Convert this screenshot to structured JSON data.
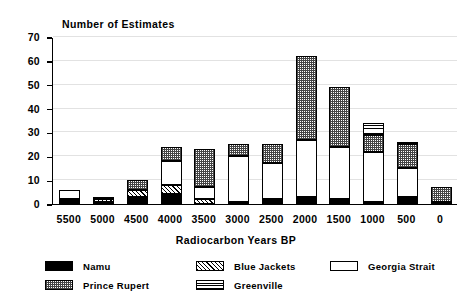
{
  "chart_data": {
    "type": "bar",
    "subtype": "stacked-bar",
    "title": "Number of Estimates",
    "xlabel": "Radiocarbon Years BP",
    "ylabel": "Number of Estimates",
    "ylim": [
      0,
      70
    ],
    "yticks": [
      0,
      10,
      20,
      30,
      40,
      50,
      60,
      70
    ],
    "grid": true,
    "legend_position": "bottom",
    "categories": [
      "5500",
      "5000",
      "4500",
      "4000",
      "3500",
      "3000",
      "2500",
      "2000",
      "1500",
      "1000",
      "500",
      "0"
    ],
    "series": [
      {
        "name": "Namu",
        "pattern": "solid-black",
        "values": [
          2,
          1,
          3,
          4,
          0,
          1,
          2,
          2,
          2,
          1,
          2,
          1
        ]
      },
      {
        "name": "Prince Rupert",
        "pattern": "dark-crosshatch",
        "values": [
          0,
          1,
          4,
          6,
          16,
          5,
          8,
          35,
          25,
          7,
          10,
          6
        ]
      },
      {
        "name": "Blue Jackets",
        "pattern": "diagonal-hatch",
        "values": [
          0,
          1,
          3,
          4,
          2,
          0,
          0,
          1,
          0,
          0,
          1,
          0
        ]
      },
      {
        "name": "Greenville",
        "pattern": "horizontal-lines",
        "values": [
          0,
          0,
          0,
          0,
          0,
          0,
          0,
          0,
          0,
          5,
          1,
          0
        ]
      },
      {
        "name": "Georgia Strait",
        "pattern": "white-empty",
        "values": [
          4,
          0,
          0,
          10,
          5,
          19,
          15,
          24,
          22,
          21,
          12,
          0
        ]
      }
    ],
    "totals": [
      6,
      3,
      10,
      24,
      23,
      25,
      25,
      62,
      49,
      34,
      26,
      7
    ],
    "stack_order": [
      "Namu",
      "Blue Jackets",
      "Georgia Strait",
      "Prince Rupert",
      "Greenville"
    ],
    "legend": [
      {
        "label": "Namu",
        "pattern": "solid-black"
      },
      {
        "label": "Blue Jackets",
        "pattern": "diagonal-hatch"
      },
      {
        "label": "Georgia Strait",
        "pattern": "white-empty"
      },
      {
        "label": "Prince Rupert",
        "pattern": "dark-crosshatch"
      },
      {
        "label": "Greenville",
        "pattern": "horizontal-lines"
      }
    ]
  }
}
